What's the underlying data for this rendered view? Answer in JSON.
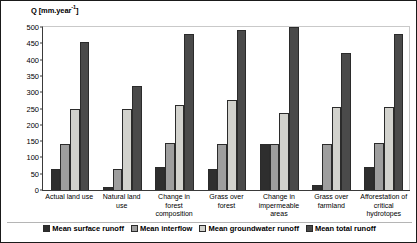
{
  "chart_data": {
    "type": "bar",
    "title": "",
    "subtitle": "",
    "xlabel": "",
    "ylabel": "Q [mm.year-1]",
    "ylabel_prefix": "Q [mm.year",
    "ylabel_exponent": "-1",
    "ylabel_suffix": "]",
    "ylim": [
      0,
      500
    ],
    "ytick_step": 50,
    "yticks": [
      500,
      450,
      400,
      350,
      300,
      250,
      200,
      150,
      100,
      50,
      0
    ],
    "grid": false,
    "legend_position": "bottom",
    "categories": [
      "Actual land use",
      "Natural land use",
      "Change in forest composition",
      "Grass over forest",
      "Change in impermeable areas",
      "Grass over farmland",
      "Afforestation of critical hydrotopes"
    ],
    "series": [
      {
        "name": "Mean surface runoff",
        "color": "#2e2e2e",
        "values": [
          65,
          8,
          70,
          65,
          140,
          15,
          70
        ]
      },
      {
        "name": "Mean interflow",
        "color": "#9e9e9e",
        "values": [
          140,
          65,
          145,
          140,
          140,
          140,
          145
        ]
      },
      {
        "name": "Mean groundwater runoff",
        "color": "#d2d2cd",
        "values": [
          250,
          250,
          260,
          275,
          235,
          255,
          255
        ]
      },
      {
        "name": "Mean total runoff",
        "color": "#4a4a4a",
        "values": [
          455,
          320,
          480,
          490,
          510,
          420,
          480
        ]
      }
    ]
  }
}
